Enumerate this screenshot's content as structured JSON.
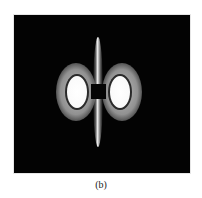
{
  "figure": {
    "caption": "(b)",
    "background_color": "#030303",
    "elements": {
      "left_lobe": {
        "center": [
          77,
          92
        ],
        "core_color": "#ffffff",
        "halo_color": "#b4b4b4"
      },
      "right_lobe": {
        "center": [
          120,
          92
        ],
        "core_color": "#ffffff",
        "halo_color": "#b4b4b4"
      },
      "vertical_streak": {
        "x": 98,
        "y_range": [
          38,
          145
        ]
      },
      "center_block": {
        "x_range": [
          91,
          106
        ],
        "y_range": [
          84,
          99
        ],
        "color": "#050505"
      }
    }
  }
}
